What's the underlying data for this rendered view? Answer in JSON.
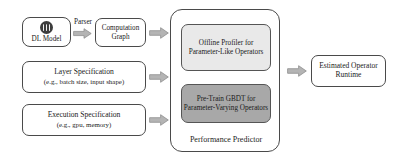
{
  "figure": {
    "type": "flow-diagram"
  },
  "inputs": {
    "dl_model": {
      "label": "DL Model",
      "icon": "neural-network-icon"
    },
    "layer_spec": {
      "title": "Layer Specification",
      "subtitle": "(e.g., batch size, input shape)"
    },
    "exec_spec": {
      "title": "Execution Specification",
      "subtitle": "(e.g., gpu, memory)"
    }
  },
  "parser": {
    "label": "Parser"
  },
  "computation_graph": {
    "line1": "Computation",
    "line2": "Graph"
  },
  "predictor": {
    "label": "Performance Predictor",
    "offline_profiler": {
      "line1": "Offline Profiler for",
      "line2": "Parameter-Like Operators",
      "fill": "#e9e9e9"
    },
    "gbdt": {
      "line1": "Pre-Train GBDT for",
      "line2": "Parameter-Varying Operators",
      "fill": "#a8a8a8"
    }
  },
  "output": {
    "line1": "Estimated Operator",
    "line2": "Runtime"
  },
  "arrows": {
    "parser_arrow": "arrow-right-icon",
    "graph_to_predictor": "arrow-right-icon",
    "layer_to_predictor": "arrow-right-icon",
    "exec_to_predictor": "arrow-right-icon",
    "predictor_to_output": "arrow-right-icon"
  },
  "colors": {
    "stroke": "#4a4a4a",
    "arrow_fill": "#b4b4b4",
    "arrow_stroke": "#8e8e8e",
    "box_fill": "#ffffff",
    "icon_fill": "#3d3d3d"
  }
}
